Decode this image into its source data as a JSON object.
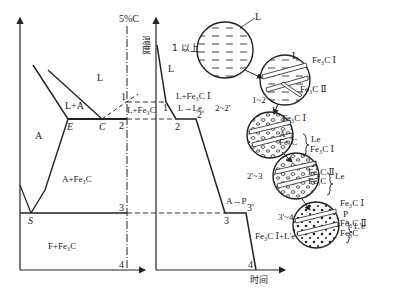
{
  "phase_diagram": {
    "composition_label": "5%C",
    "regions": {
      "liquid": "L",
      "liquid_austenite": "L+A",
      "liquid_cementite": "L+Fe₃C",
      "austenite": "A",
      "austenite_cementite": "A+Fe₃C",
      "ferrite_cementite": "F+Fe₃C"
    },
    "points": {
      "E": "E",
      "C": "C",
      "S": "S"
    },
    "alloy_points": [
      "1",
      "2",
      "3",
      "4"
    ]
  },
  "cooling_curve": {
    "y_axis_label": "温度",
    "x_axis_label": "时间",
    "segment_labels": {
      "liquid": "L",
      "primary": "L+Fe₃C Ⅰ",
      "eutectic": "L→Le",
      "eutectoid": "A→P",
      "final": "Fe₃C Ⅰ+L'e"
    },
    "points": [
      "1",
      "2",
      "2'",
      "3",
      "3'",
      "4"
    ]
  },
  "microstructures": [
    {
      "stage": "1 以上",
      "labels": [
        "L"
      ]
    },
    {
      "stage": "1~2",
      "labels": [
        "L",
        "Fe₃C Ⅰ",
        "Fe₃C Ⅱ"
      ]
    },
    {
      "stage": "2~2'",
      "labels": [
        "L",
        "Fe₃C Ⅰ",
        "A",
        "Fe₃C"
      ],
      "group": "Le"
    },
    {
      "stage": "2'~3",
      "labels": [
        "Fe₃C Ⅰ",
        "A",
        "Fe₃C Ⅱ",
        "Fe₃C"
      ],
      "group": "Le"
    },
    {
      "stage": "3'~4",
      "labels": [
        "Fe₃C Ⅰ",
        "P",
        "Fe₃C Ⅱ",
        "Fe₃C"
      ],
      "group": "L'e"
    }
  ]
}
